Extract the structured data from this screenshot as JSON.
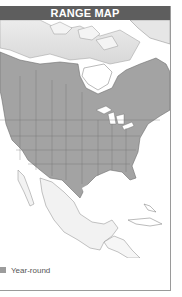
{
  "header": {
    "title": "RANGE MAP"
  },
  "legend": {
    "items": [
      {
        "label": "Year-round",
        "color": "#9c9c9c"
      }
    ]
  },
  "map": {
    "region": "North America",
    "colors": {
      "range_fill": "#a3a3a3",
      "outside_range": "#ffffff",
      "faded_north": "#e3e3e3",
      "borders": "#6e6e6e"
    }
  }
}
